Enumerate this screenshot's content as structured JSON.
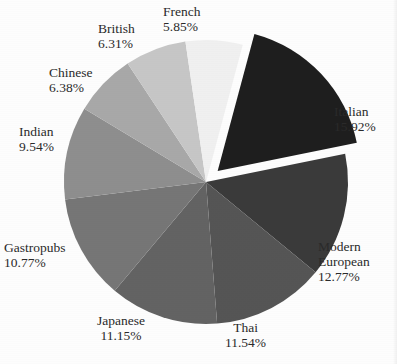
{
  "chart_data": {
    "type": "pie",
    "title": "",
    "xlabel": "",
    "ylabel": "",
    "legend_position": "none",
    "grid": false,
    "labels_show_percent": true,
    "start_angle_deg": -75,
    "direction": "clockwise",
    "exploded_slice": "Italian",
    "categories": [
      "Italian",
      "Modern European",
      "Thai",
      "Japanese",
      "Gastropubs",
      "Indian",
      "Chinese",
      "British",
      "French"
    ],
    "values": [
      15.92,
      12.77,
      11.54,
      11.15,
      10.77,
      9.54,
      6.38,
      6.31,
      5.85
    ],
    "value_labels": [
      "15.92%",
      "12.77%",
      "11.54%",
      "11.15%",
      "10.77%",
      "9.54%",
      "6.38%",
      "6.31%",
      "5.85%"
    ],
    "colors": [
      "#1e1e1e",
      "#3a3a3a",
      "#555555",
      "#636363",
      "#767676",
      "#8e8e8e",
      "#a8a8a8",
      "#c6c6c6",
      "#f0f0f0"
    ],
    "slices": [
      {
        "name": "Italian",
        "value": 15.92,
        "value_label": "15.92%",
        "color": "#1e1e1e",
        "exploded": true
      },
      {
        "name": "Modern European",
        "value": 12.77,
        "value_label": "12.77%",
        "color": "#3a3a3a",
        "exploded": false
      },
      {
        "name": "Thai",
        "value": 11.54,
        "value_label": "11.54%",
        "color": "#555555",
        "exploded": false
      },
      {
        "name": "Japanese",
        "value": 11.15,
        "value_label": "11.15%",
        "color": "#636363",
        "exploded": false
      },
      {
        "name": "Gastropubs",
        "value": 10.77,
        "value_label": "10.77%",
        "color": "#767676",
        "exploded": false
      },
      {
        "name": "Indian",
        "value": 9.54,
        "value_label": "9.54%",
        "color": "#8e8e8e",
        "exploded": false
      },
      {
        "name": "Chinese",
        "value": 6.38,
        "value_label": "6.38%",
        "color": "#a8a8a8",
        "exploded": false
      },
      {
        "name": "British",
        "value": 6.31,
        "value_label": "6.31%",
        "color": "#c6c6c6",
        "exploded": false
      },
      {
        "name": "French",
        "value": 5.85,
        "value_label": "5.85%",
        "color": "#f0f0f0",
        "exploded": false
      }
    ]
  },
  "labels": {
    "italian": {
      "name": "Italian",
      "pct": "15.92%"
    },
    "modern": {
      "name": "Modern",
      "name2": "European",
      "pct": "12.77%"
    },
    "thai": {
      "name": "Thai",
      "pct": "11.54%"
    },
    "japanese": {
      "name": "Japanese",
      "pct": "11.15%"
    },
    "gastro": {
      "name": "Gastropubs",
      "pct": "10.77%"
    },
    "indian": {
      "name": "Indian",
      "pct": "9.54%"
    },
    "chinese": {
      "name": "Chinese",
      "pct": "6.38%"
    },
    "british": {
      "name": "British",
      "pct": "6.31%"
    },
    "french": {
      "name": "French",
      "pct": "5.85%"
    }
  }
}
